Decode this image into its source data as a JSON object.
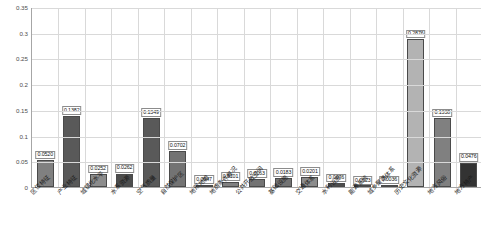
{
  "chart_data": {
    "type": "bar",
    "title": "",
    "xlabel": "",
    "ylabel": "",
    "ylim": [
      0,
      0.35
    ],
    "ytick_values": [
      0,
      0.05,
      0.1,
      0.15,
      0.2,
      0.25,
      0.3,
      0.35
    ],
    "ytick_labels": [
      "0",
      "0.05",
      "0.1",
      "0.15",
      "0.2",
      "0.25",
      "0.3",
      "0.35"
    ],
    "grid": true,
    "legend": "none",
    "categories": [
      "区位特征",
      "产业特征",
      "城镇化水平",
      "水系资源",
      "空气质量",
      "自然保护区",
      "地形地貌",
      "地质条件概况",
      "公共开放空间",
      "基础设施",
      "交通体系",
      "水利设施",
      "能源系统",
      "城乡聚落体系",
      "历史文化资源",
      "地方风俗",
      "地方特产"
    ],
    "values": [
      0.052,
      0.1382,
      0.0252,
      0.0262,
      0.1349,
      0.0702,
      0.0047,
      0.0101,
      0.0163,
      0.0183,
      0.0201,
      0.0076,
      0.0023,
      0.0036,
      0.2876,
      0.1338,
      0.0476
    ],
    "value_labels": [
      "0.0520",
      "0.1382",
      "0.0252",
      "0.0262",
      "0.1349",
      "0.0702",
      "0.0047",
      "0.0101",
      "0.0163",
      "0.0183",
      "0.0201",
      "0.0076",
      "0.0023",
      "0.0036",
      "0.2876",
      "0.1338",
      "0.0476"
    ],
    "bar_colors": [
      "#808080",
      "#595959",
      "#8c8c8c",
      "#4d4d4d",
      "#595959",
      "#737373",
      "#8c8c8c",
      "#808080",
      "#737373",
      "#737373",
      "#8c8c8c",
      "#4d4d4d",
      "#a6a6a6",
      "#404040",
      "#b3b3b3",
      "#808080",
      "#333333"
    ],
    "axis_color": "#a6a6a6",
    "grid_color": "#d9d9d9",
    "background": "#ffffff"
  }
}
